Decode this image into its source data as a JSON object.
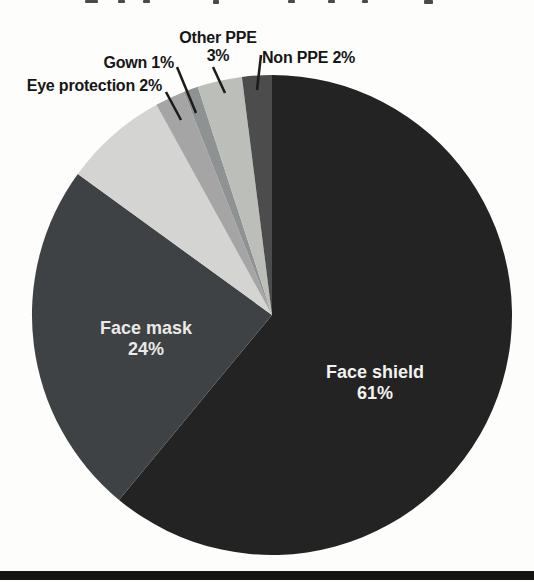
{
  "figure": {
    "background_color": "#fdfdfc",
    "bottom_bar_color": "#141414"
  },
  "chart_data": {
    "type": "pie",
    "title": "",
    "legend": "none",
    "start_angle_deg": 0,
    "direction": "clockwise",
    "center": {
      "x": 272,
      "y": 315
    },
    "radius": 240,
    "slices": [
      {
        "name": "Face shield",
        "value": 61,
        "color": "#232323",
        "label": {
          "style": "inside",
          "line1": "Face shield",
          "line2": "61%",
          "x": 375,
          "y": 378,
          "color": "#f2f2f0"
        }
      },
      {
        "name": "Face mask",
        "value": 24,
        "color": "#3f4245",
        "label": {
          "style": "inside",
          "line1": "Face mask",
          "line2": "24%",
          "x": 146,
          "y": 334,
          "color": "#e9e9e7"
        }
      },
      {
        "name": "",
        "value": 7,
        "color": "#d4d5d2",
        "label": {
          "style": "none"
        }
      },
      {
        "name": "Eye protection",
        "value": 2,
        "color": "#a5a5a5",
        "label": {
          "style": "callout",
          "text": "Eye protection 2%"
        }
      },
      {
        "name": "Gown",
        "value": 1,
        "color": "#8f9292",
        "label": {
          "style": "callout",
          "text": "Gown 1%"
        }
      },
      {
        "name": "Other PPE",
        "value": 3,
        "color": "#bcbeb9",
        "label": {
          "style": "callout",
          "line1": "Other PPE",
          "line2": "3%"
        }
      },
      {
        "name": "Non PPE",
        "value": 2,
        "color": "#4c4c4c",
        "label": {
          "style": "callout",
          "text": "Non PPE 2%"
        }
      }
    ]
  }
}
